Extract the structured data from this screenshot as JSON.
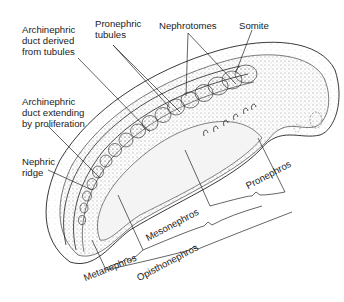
{
  "figure": {
    "colors": {
      "ink": "#222222",
      "stipple": "#9a9a9a",
      "background": "#ffffff"
    }
  },
  "labels": {
    "archinephric_derived": "Archinephric\nduct derived\nfrom tubules",
    "pronephric_tubules": "Pronephric\ntubules",
    "nephrotomes": "Nephrotomes",
    "somite": "Somite",
    "archinephric_extending": "Archinephric\nduct extending\nby proliferation",
    "nephric_ridge": "Nephric\nridge"
  },
  "regions": {
    "pronephros": "Pronephros",
    "mesonephros": "Mesonephros",
    "metanephros": "Metanephros",
    "opisthonephros": "Opisthonephros"
  }
}
